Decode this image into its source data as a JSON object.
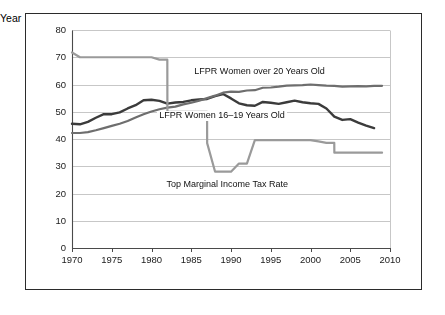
{
  "chart_data": {
    "type": "line",
    "title": "",
    "xlabel": "Year",
    "ylabel": "Percent",
    "xlim": [
      1970,
      2010
    ],
    "ylim": [
      0,
      80
    ],
    "ytick_step": 10,
    "xtick_step": 5,
    "grid": "horizontal",
    "legend_position": "inline-annotations",
    "xticks": [
      "1970",
      "1975",
      "1980",
      "1985",
      "1990",
      "1995",
      "2000",
      "2005",
      "2010"
    ],
    "yticks": [
      "0",
      "10",
      "20",
      "30",
      "40",
      "50",
      "60",
      "70",
      "80"
    ],
    "series": [
      {
        "name": "LFPR Women 16–19 Years Old",
        "color": "#3b3b3b",
        "width": 2.4,
        "label_x": 1988.5,
        "label_y": 48.5,
        "x": [
          1970,
          1971,
          1972,
          1973,
          1974,
          1975,
          1976,
          1977,
          1978,
          1979,
          1980,
          1981,
          1982,
          1983,
          1984,
          1985,
          1986,
          1987,
          1988,
          1989,
          1990,
          1991,
          1992,
          1993,
          1994,
          1995,
          1996,
          1997,
          1998,
          1999,
          2000,
          2001,
          2002,
          2003,
          2004,
          2005,
          2006,
          2007,
          2008
        ],
        "values": [
          45.6,
          45.4,
          46.3,
          47.8,
          49.1,
          49.1,
          49.8,
          51.2,
          52.4,
          54.2,
          54.4,
          54.0,
          53.0,
          53.4,
          53.6,
          54.2,
          54.5,
          54.7,
          55.7,
          56.5,
          54.9,
          53.1,
          52.4,
          52.2,
          53.6,
          53.3,
          52.9,
          53.5,
          54.1,
          53.5,
          53.1,
          52.9,
          51.2,
          48.2,
          47.0,
          47.3,
          46.0,
          44.9,
          44.0
        ]
      },
      {
        "name": "LFPR Women over 20 Years Old",
        "color": "#6e6e6e",
        "width": 2.2,
        "label_x": 1993.5,
        "label_y": 64.5,
        "x": [
          1970,
          1971,
          1972,
          1973,
          1974,
          1975,
          1976,
          1977,
          1978,
          1979,
          1980,
          1981,
          1982,
          1983,
          1984,
          1985,
          1986,
          1987,
          1988,
          1989,
          1990,
          1991,
          1992,
          1993,
          1994,
          1995,
          1996,
          1997,
          1998,
          1999,
          2000,
          2001,
          2002,
          2003,
          2004,
          2005,
          2006,
          2007,
          2008,
          2009
        ],
        "values": [
          42.2,
          42.2,
          42.5,
          43.2,
          44.0,
          44.8,
          45.6,
          46.6,
          47.9,
          49.1,
          50.1,
          50.9,
          51.5,
          51.9,
          52.7,
          53.3,
          54.1,
          55.0,
          55.9,
          57.0,
          57.4,
          57.3,
          57.8,
          57.9,
          58.8,
          58.9,
          59.2,
          59.6,
          59.7,
          59.8,
          60.0,
          59.8,
          59.6,
          59.5,
          59.2,
          59.3,
          59.4,
          59.3,
          59.5,
          59.5
        ]
      },
      {
        "name": "Top Marginal Income Tax Rate",
        "color": "#9a9a9a",
        "width": 2.2,
        "label_x": 1990.0,
        "label_y": 23.0,
        "x": [
          1970,
          1971,
          1972,
          1973,
          1974,
          1975,
          1976,
          1977,
          1978,
          1979,
          1980,
          1981,
          1981.99,
          1982,
          1983,
          1984,
          1985,
          1986,
          1986.99,
          1987,
          1988,
          1989,
          1990,
          1991,
          1992,
          1993,
          1994,
          1995,
          1996,
          1997,
          1998,
          1999,
          2000,
          2001,
          2002,
          2002.99,
          2003,
          2004,
          2005,
          2006,
          2007,
          2008,
          2009
        ],
        "values": [
          71.75,
          70,
          70,
          70,
          70,
          70,
          70,
          70,
          70,
          70,
          70,
          69.125,
          69.125,
          50,
          50,
          50,
          50,
          50,
          50,
          38.5,
          28,
          28,
          28,
          31,
          31,
          39.6,
          39.6,
          39.6,
          39.6,
          39.6,
          39.6,
          39.6,
          39.6,
          39.1,
          38.6,
          38.6,
          35,
          35,
          35,
          35,
          35,
          35,
          35
        ]
      }
    ]
  },
  "axes": {
    "y_axis_title": "Percent",
    "x_axis_title": "Year"
  }
}
